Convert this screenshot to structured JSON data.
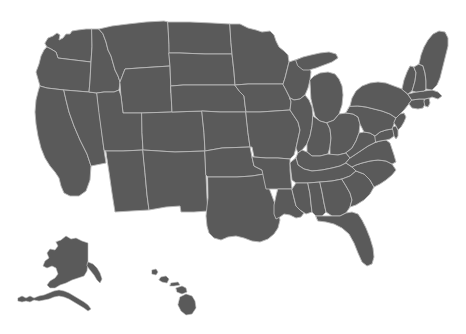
{
  "map": {
    "title": "United States map",
    "region_label": "United States of America",
    "projection": "albers-usa",
    "background_color": "#ffffff",
    "fill_color": "#5a5a5a",
    "border_color": "#b9b9b9",
    "has_legend": false,
    "has_labels": false,
    "has_title_text": false,
    "insets": [
      {
        "name": "alaska-inset",
        "label": "Alaska"
      },
      {
        "name": "hawaii-inset",
        "label": "Hawaii"
      }
    ],
    "states": [
      {
        "code": "WA",
        "name": "Washington"
      },
      {
        "code": "OR",
        "name": "Oregon"
      },
      {
        "code": "CA",
        "name": "California"
      },
      {
        "code": "NV",
        "name": "Nevada"
      },
      {
        "code": "ID",
        "name": "Idaho"
      },
      {
        "code": "MT",
        "name": "Montana"
      },
      {
        "code": "WY",
        "name": "Wyoming"
      },
      {
        "code": "UT",
        "name": "Utah"
      },
      {
        "code": "AZ",
        "name": "Arizona"
      },
      {
        "code": "CO",
        "name": "Colorado"
      },
      {
        "code": "NM",
        "name": "New Mexico"
      },
      {
        "code": "ND",
        "name": "North Dakota"
      },
      {
        "code": "SD",
        "name": "South Dakota"
      },
      {
        "code": "NE",
        "name": "Nebraska"
      },
      {
        "code": "KS",
        "name": "Kansas"
      },
      {
        "code": "OK",
        "name": "Oklahoma"
      },
      {
        "code": "TX",
        "name": "Texas"
      },
      {
        "code": "MN",
        "name": "Minnesota"
      },
      {
        "code": "IA",
        "name": "Iowa"
      },
      {
        "code": "MO",
        "name": "Missouri"
      },
      {
        "code": "AR",
        "name": "Arkansas"
      },
      {
        "code": "LA",
        "name": "Louisiana"
      },
      {
        "code": "WI",
        "name": "Wisconsin"
      },
      {
        "code": "IL",
        "name": "Illinois"
      },
      {
        "code": "MI",
        "name": "Michigan"
      },
      {
        "code": "IN",
        "name": "Indiana"
      },
      {
        "code": "OH",
        "name": "Ohio"
      },
      {
        "code": "KY",
        "name": "Kentucky"
      },
      {
        "code": "TN",
        "name": "Tennessee"
      },
      {
        "code": "MS",
        "name": "Mississippi"
      },
      {
        "code": "AL",
        "name": "Alabama"
      },
      {
        "code": "GA",
        "name": "Georgia"
      },
      {
        "code": "FL",
        "name": "Florida"
      },
      {
        "code": "SC",
        "name": "South Carolina"
      },
      {
        "code": "NC",
        "name": "North Carolina"
      },
      {
        "code": "VA",
        "name": "Virginia"
      },
      {
        "code": "WV",
        "name": "West Virginia"
      },
      {
        "code": "MD",
        "name": "Maryland"
      },
      {
        "code": "DE",
        "name": "Delaware"
      },
      {
        "code": "PA",
        "name": "Pennsylvania"
      },
      {
        "code": "NJ",
        "name": "New Jersey"
      },
      {
        "code": "NY",
        "name": "New York"
      },
      {
        "code": "CT",
        "name": "Connecticut"
      },
      {
        "code": "RI",
        "name": "Rhode Island"
      },
      {
        "code": "MA",
        "name": "Massachusetts"
      },
      {
        "code": "VT",
        "name": "Vermont"
      },
      {
        "code": "NH",
        "name": "New Hampshire"
      },
      {
        "code": "ME",
        "name": "Maine"
      },
      {
        "code": "AK",
        "name": "Alaska"
      },
      {
        "code": "HI",
        "name": "Hawaii"
      }
    ]
  }
}
